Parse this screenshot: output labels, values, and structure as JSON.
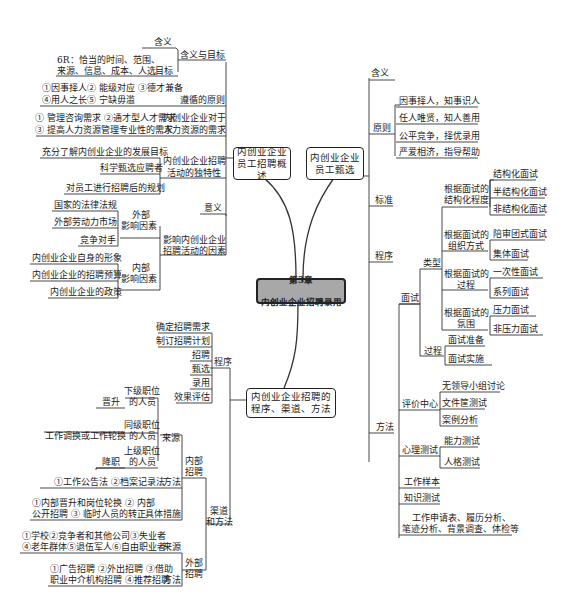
{
  "root": {
    "line1": "第3章",
    "line2": "内创业企业招聘录用"
  },
  "overview": {
    "title": "内创业企业\n员工招聘概述",
    "meaning_goal": {
      "label": "含义与目标",
      "meaning": "含义",
      "goal": "目标",
      "goal_detail_1": "6R：恰当的时间、范围、",
      "goal_detail_2": "来源、信息、成本、人选"
    },
    "principles": {
      "label": "遵循的原则",
      "line1": "①因事择人② 能级对应 ③德才兼备",
      "line2": "④用人之长⑤ 宁缺毋滥"
    },
    "hr_needs": {
      "label_1": "内创业企业对于",
      "label_2": "人力资源的需求",
      "line1": "① 管理咨询需求 ②通才型人才需求",
      "line2": "③ 提高人力资源管理专业性的需求"
    },
    "uniqueness": {
      "label_1": "内创业企业招聘",
      "label_2": "活动的独特性",
      "items": [
        "充分了解内创业企业的发展目标",
        "科学甄选应聘者",
        "对员工进行招聘后的规划"
      ]
    },
    "significance": "意义",
    "factors": {
      "label_1": "影响内创业企业",
      "label_2": "招聘活动的因素",
      "external": {
        "label_1": "外部",
        "label_2": "影响因素",
        "items": [
          "国家的法律法规",
          "外部劳动力市场",
          "竞争对手"
        ]
      },
      "internal": {
        "label_1": "内部",
        "label_2": "影响因素",
        "items": [
          "内创业企业自身的形象",
          "内创业企业的招聘预算",
          "内创业企业的政策"
        ]
      }
    }
  },
  "selection": {
    "title": "内创业企业\n员工甄选",
    "meaning": "含义",
    "principles": {
      "label": "原则",
      "items": [
        "因事择人，知事识人",
        "任人唯贤，知人善用",
        "公平竞争，择优录用",
        "严爱相济，指导帮助"
      ]
    },
    "standard": "标准",
    "procedure": "程序",
    "methods": {
      "label": "方法",
      "interview": {
        "label": "面试",
        "types": {
          "label": "类型",
          "groups": [
            {
              "label_1": "根据面试的",
              "label_2": "结构化程度",
              "items": [
                "结构化面试",
                "半结构化面试",
                "非结构化面试"
              ]
            },
            {
              "label_1": "根据面试的",
              "label_2": "组织方式",
              "items": [
                "陪审团式面试",
                "集体面试"
              ]
            },
            {
              "label_1": "根据面试的",
              "label_2": "过程",
              "items": [
                "一次性面试",
                "系列面试"
              ]
            },
            {
              "label_1": "根据面试的",
              "label_2": "氛围",
              "items": [
                "压力面试",
                "非压力面试"
              ]
            }
          ]
        },
        "process": {
          "label": "过程",
          "items": [
            "面试准备",
            "面试实施"
          ]
        }
      },
      "assessment_center": {
        "label": "评价中心",
        "items": [
          "无领导小组讨论",
          "文件筐测试",
          "案例分析"
        ]
      },
      "psych_test": {
        "label": "心理测试",
        "items": [
          "能力测试",
          "人格测试"
        ]
      },
      "work_sample": "工作样本",
      "knowledge_test": "知识测试",
      "others_1": "工作申请表、履历分析、",
      "others_2": "笔迹分析、背景调查、体检等"
    }
  },
  "process_channels": {
    "title": "内创业企业招聘的\n程序、渠道、方法",
    "procedure": {
      "label": "程序",
      "items": [
        "确定招聘需求",
        "制订招聘计划",
        "招聘",
        "甄选",
        "录用",
        "效果评估"
      ]
    },
    "channels": {
      "label_1": "渠道",
      "label_2": "和方法",
      "internal": {
        "label_1": "内部",
        "label_2": "招聘",
        "source": {
          "label": "来源",
          "items": [
            {
              "who_1": "下级职位",
              "who_2": "的人员",
              "how": "晋升"
            },
            {
              "who_1": "同级职位",
              "who_2": "的人员",
              "how": "工作调换或工作轮换"
            },
            {
              "who_1": "上级职位",
              "who_2": "的人员",
              "how": "降职"
            }
          ]
        },
        "method": {
          "label": "方法",
          "text": "①工作公告法 ②档案记录法"
        },
        "measures": {
          "label": "具体措施",
          "line1": "①内部晋升和岗位轮换 ② 内部",
          "line2": "公开招聘 ③ 临时人员的转正"
        }
      },
      "external": {
        "label_1": "外部",
        "label_2": "招聘",
        "source": {
          "label": "来源",
          "line1": "①学校②竞争者和其他公司③失业者",
          "line2": "④老年群体⑤退伍军人⑥自由职业者"
        },
        "method": {
          "label": "方法",
          "line1": "①广告招聘 ②外出招聘 ③借助",
          "line2": "职业中介机构招聘 ④推荐招聘"
        }
      }
    }
  }
}
